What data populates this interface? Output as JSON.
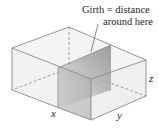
{
  "diagram": {
    "type": "3d-box-with-cross-section",
    "annotation": {
      "line1": "Girth = distance",
      "line2": "around here"
    },
    "axes_labels": {
      "x": "x",
      "y": "y",
      "z": "z"
    },
    "colors": {
      "edge": "#8a8a8a",
      "face": "#f0f0f0",
      "section_dark": "#8c8c8c",
      "section_light": "#d4d4d4",
      "text": "#231f20"
    }
  }
}
